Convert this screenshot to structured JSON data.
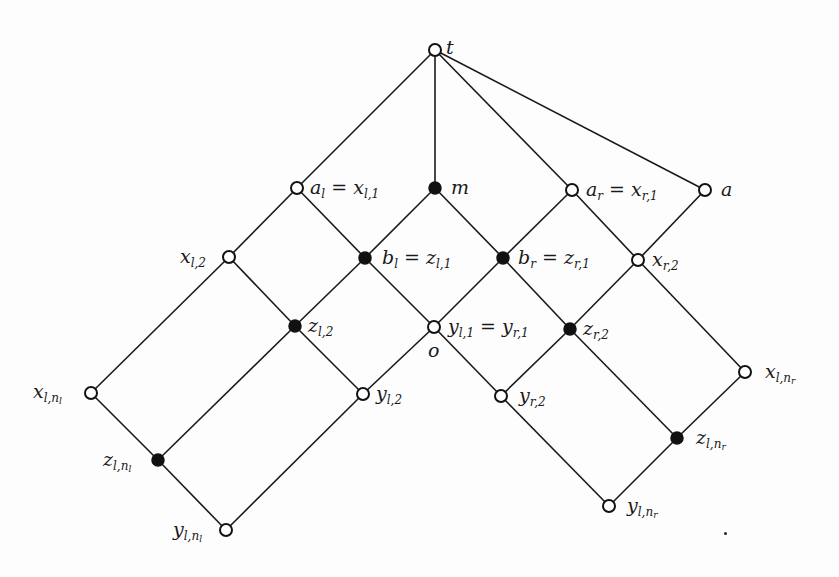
{
  "diagram": {
    "type": "lattice",
    "colors": {
      "line": "#1a1a1a",
      "node_fill_open": "#ffffff",
      "node_fill_filled": "#111111"
    },
    "nodes": [
      {
        "id": "t",
        "x": 435,
        "y": 50,
        "filled": false,
        "label_main": "t",
        "label_sub": "",
        "label_subsub": "",
        "label_suffix": "",
        "lx": 446,
        "ly": 38
      },
      {
        "id": "a_l",
        "x": 297,
        "y": 188,
        "filled": false,
        "label_main": "a",
        "label_sub": "l",
        "label_subsub": "",
        "label_suffix": " = x",
        "suffix_sub": "l,1",
        "lx": 310,
        "ly": 178
      },
      {
        "id": "m",
        "x": 435,
        "y": 188,
        "filled": true,
        "label_main": "m",
        "label_sub": "",
        "label_subsub": "",
        "label_suffix": "",
        "lx": 451,
        "ly": 178
      },
      {
        "id": "a_r",
        "x": 572,
        "y": 190,
        "filled": false,
        "label_main": "a",
        "label_sub": "r",
        "label_subsub": "",
        "label_suffix": " = x",
        "suffix_sub": "r,1",
        "lx": 586,
        "ly": 180
      },
      {
        "id": "a",
        "x": 705,
        "y": 190,
        "filled": false,
        "label_main": "a",
        "label_sub": "",
        "label_subsub": "",
        "label_suffix": "",
        "lx": 721,
        "ly": 180
      },
      {
        "id": "x_l2",
        "x": 229,
        "y": 257,
        "filled": false,
        "label_main": "x",
        "label_sub": "l,2",
        "label_subsub": "",
        "label_suffix": "",
        "lx": 180,
        "ly": 247
      },
      {
        "id": "b_l",
        "x": 365,
        "y": 258,
        "filled": true,
        "label_main": "b",
        "label_sub": "l",
        "label_subsub": "",
        "label_suffix": " = z",
        "suffix_sub": "l,1",
        "lx": 382,
        "ly": 248
      },
      {
        "id": "b_r",
        "x": 503,
        "y": 258,
        "filled": true,
        "label_main": "b",
        "label_sub": "r",
        "label_subsub": "",
        "label_suffix": " = z",
        "suffix_sub": "r,1",
        "lx": 518,
        "ly": 248
      },
      {
        "id": "x_r2",
        "x": 638,
        "y": 260,
        "filled": false,
        "label_main": "x",
        "label_sub": "r,2",
        "label_subsub": "",
        "label_suffix": "",
        "lx": 652,
        "ly": 250
      },
      {
        "id": "z_l2",
        "x": 295,
        "y": 326,
        "filled": true,
        "label_main": "z",
        "label_sub": "l,2",
        "label_subsub": "",
        "label_suffix": "",
        "lx": 308,
        "ly": 316
      },
      {
        "id": "o",
        "x": 434,
        "y": 327,
        "filled": false,
        "label_main": "y",
        "label_sub": "l,1",
        "label_subsub": "",
        "label_suffix": " = y",
        "suffix_sub": "r,1",
        "lx": 448,
        "ly": 317
      },
      {
        "id": "z_r2",
        "x": 570,
        "y": 329,
        "filled": true,
        "label_main": "z",
        "label_sub": "r,2",
        "label_subsub": "",
        "label_suffix": "",
        "lx": 583,
        "ly": 319
      },
      {
        "id": "x_lnl",
        "x": 91,
        "y": 393,
        "filled": false,
        "label_main": "x",
        "label_sub": "l,n",
        "label_subsub": "l",
        "label_suffix": "",
        "lx": 33,
        "ly": 382
      },
      {
        "id": "y_l2",
        "x": 363,
        "y": 394,
        "filled": false,
        "label_main": "y",
        "label_sub": "l,2",
        "label_subsub": "",
        "label_suffix": "",
        "lx": 376,
        "ly": 384
      },
      {
        "id": "y_r2",
        "x": 501,
        "y": 396,
        "filled": false,
        "label_main": "y",
        "label_sub": "r,2",
        "label_subsub": "",
        "label_suffix": "",
        "lx": 519,
        "ly": 386
      },
      {
        "id": "x_lnr",
        "x": 745,
        "y": 372,
        "filled": false,
        "label_main": "x",
        "label_sub": "l,n",
        "label_subsub": "r",
        "label_suffix": "",
        "lx": 765,
        "ly": 362
      },
      {
        "id": "z_lnl",
        "x": 158,
        "y": 460,
        "filled": true,
        "label_main": "z",
        "label_sub": "l,n",
        "label_subsub": "l",
        "label_suffix": "",
        "lx": 103,
        "ly": 450
      },
      {
        "id": "z_lnr",
        "x": 677,
        "y": 438,
        "filled": true,
        "label_main": "z",
        "label_sub": "l,n",
        "label_subsub": "r",
        "label_suffix": "",
        "lx": 696,
        "ly": 428
      },
      {
        "id": "y_lnl",
        "x": 226,
        "y": 530,
        "filled": false,
        "label_main": "y",
        "label_sub": "l,n",
        "label_subsub": "l",
        "label_suffix": "",
        "lx": 173,
        "ly": 520
      },
      {
        "id": "y_lnr",
        "x": 609,
        "y": 506,
        "filled": false,
        "label_main": "y",
        "label_sub": "l,n",
        "label_subsub": "r",
        "label_suffix": "",
        "lx": 627,
        "ly": 496
      }
    ],
    "extra_labels": [
      {
        "id": "o_label",
        "text": "o",
        "x": 428,
        "y": 341
      }
    ],
    "edges": [
      [
        "t",
        "a_l"
      ],
      [
        "t",
        "m"
      ],
      [
        "t",
        "a_r"
      ],
      [
        "t",
        "a"
      ],
      [
        "a_l",
        "x_l2"
      ],
      [
        "a_l",
        "b_l"
      ],
      [
        "m",
        "b_l"
      ],
      [
        "m",
        "b_r"
      ],
      [
        "a_r",
        "b_r"
      ],
      [
        "a_r",
        "x_r2"
      ],
      [
        "a",
        "x_r2"
      ],
      [
        "x_l2",
        "x_lnl"
      ],
      [
        "x_l2",
        "z_l2"
      ],
      [
        "b_l",
        "z_l2"
      ],
      [
        "b_l",
        "o"
      ],
      [
        "b_r",
        "o"
      ],
      [
        "b_r",
        "z_r2"
      ],
      [
        "x_r2",
        "z_r2"
      ],
      [
        "x_r2",
        "x_lnr"
      ],
      [
        "z_l2",
        "z_lnl"
      ],
      [
        "z_l2",
        "y_l2"
      ],
      [
        "o",
        "y_l2"
      ],
      [
        "o",
        "y_r2"
      ],
      [
        "z_r2",
        "y_r2"
      ],
      [
        "z_r2",
        "z_lnr"
      ],
      [
        "x_lnl",
        "z_lnl"
      ],
      [
        "z_lnl",
        "y_lnl"
      ],
      [
        "y_l2",
        "y_lnl"
      ],
      [
        "x_lnr",
        "z_lnr"
      ],
      [
        "z_lnr",
        "y_lnr"
      ],
      [
        "y_r2",
        "y_lnr"
      ]
    ],
    "node_radius": 6
  }
}
